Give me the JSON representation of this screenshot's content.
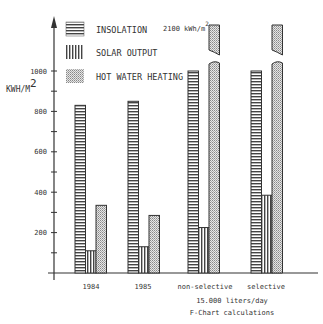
{
  "chart_data": {
    "type": "bar",
    "title": "",
    "xlabel": "15.000 liters/day",
    "subtitle": "F-Chart calculations",
    "ylabel": "KWH/M2",
    "ylim": [
      0,
      1000
    ],
    "yticks": [
      200,
      400,
      600,
      800,
      1000
    ],
    "ytick_labels": [
      "200",
      "400",
      "600",
      "800",
      "1000"
    ],
    "grid": false,
    "legend_position": "top-left",
    "categories": [
      "1984",
      "1985",
      "non-selective",
      "selective"
    ],
    "series": [
      {
        "name": "INSOLATION",
        "pattern": "horizontal-stripes",
        "values": [
          830,
          850,
          1000,
          1000
        ]
      },
      {
        "name": "SOLAR OUTPUT",
        "pattern": "vertical-stripes",
        "values": [
          110,
          130,
          225,
          385
        ]
      },
      {
        "name": "HOT WATER HEATING",
        "pattern": "dotted",
        "values": [
          335,
          285,
          2100,
          2100
        ]
      }
    ],
    "annotations": [
      {
        "text": "2100 kWh/m2",
        "target": "HOT WATER HEATING bars (non-selective, selective) — axis broken"
      }
    ]
  },
  "labels": {
    "ylabel": "KWH/M",
    "ylabel_sup": "2",
    "annotation": "2100 kWh/m",
    "annotation_sup": "2",
    "legend": [
      "INSOLATION",
      "SOLAR OUTPUT",
      "HOT WATER HEATING"
    ],
    "categories": [
      "1984",
      "1985",
      "non-selective",
      "selective"
    ],
    "ticks": [
      "200",
      "400",
      "600",
      "800",
      "1000"
    ],
    "xlabel": "15.000 liters/day",
    "subtitle": "F-Chart calculations"
  },
  "colors": {
    "ink": "#333333",
    "background": "#ffffff"
  }
}
